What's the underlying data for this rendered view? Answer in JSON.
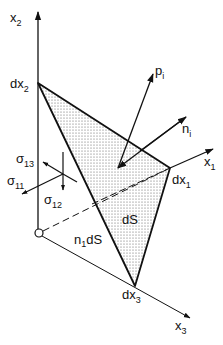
{
  "diagram": {
    "type": "tetrahedron-stress",
    "axes": {
      "x1": {
        "label": "x",
        "sub": "1"
      },
      "x2": {
        "label": "x",
        "sub": "2"
      },
      "x3": {
        "label": "x",
        "sub": "3"
      }
    },
    "vertices": {
      "dx1": {
        "label": "dx",
        "sub": "1"
      },
      "dx2": {
        "label": "dx",
        "sub": "2"
      },
      "dx3": {
        "label": "dx",
        "sub": "3"
      }
    },
    "vectors": {
      "p": {
        "label": "p",
        "sub": "i"
      },
      "n": {
        "label": "n",
        "sub": "i"
      }
    },
    "stresses": {
      "s13": {
        "label": "σ",
        "sub": "13"
      },
      "s11": {
        "label": "σ",
        "sub": "11"
      },
      "s12": {
        "label": "σ",
        "sub": "12"
      }
    },
    "areas": {
      "dS": "dS",
      "n1dS": {
        "pre": "n",
        "sub": "1",
        "post": "dS"
      }
    },
    "colors": {
      "line": "#111111",
      "fill_dots": "#555555",
      "background": "#ffffff"
    }
  }
}
